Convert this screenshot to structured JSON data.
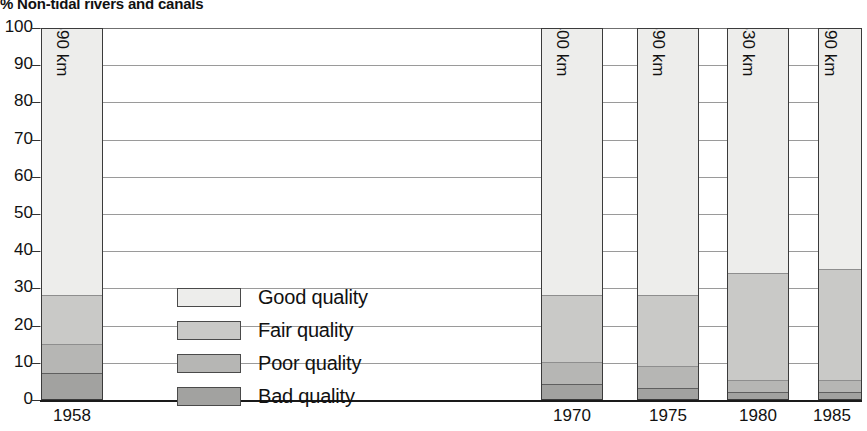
{
  "chart_data": {
    "type": "bar",
    "title": "% Non-tidal rivers and canals",
    "subtitle": "",
    "xlabel": "",
    "ylabel": "",
    "ylim": [
      0,
      100
    ],
    "yticks": [
      0,
      10,
      20,
      30,
      40,
      50,
      60,
      70,
      80,
      90,
      100
    ],
    "grid": true,
    "stacked": true,
    "stack_total_percent": 100,
    "legend_position": "inside-left-center",
    "categories": [
      "1958",
      "1970",
      "1975",
      "1980",
      "1985"
    ],
    "bar_annotations": [
      "34690 km",
      "38400 km",
      "38590 km",
      "40630 km",
      "41390 km"
    ],
    "series": [
      {
        "name": "Good quality",
        "color": "#ededeb",
        "values": [
          72,
          72,
          72,
          66,
          65
        ]
      },
      {
        "name": "Fair quality",
        "color": "#c9c9c7",
        "values": [
          13,
          18,
          19,
          29,
          30
        ]
      },
      {
        "name": "Poor quality",
        "color": "#b6b6b4",
        "values": [
          8,
          6,
          6,
          3,
          3
        ]
      },
      {
        "name": "Bad quality",
        "color": "#a2a2a0",
        "values": [
          7,
          4,
          3,
          2,
          2
        ]
      }
    ]
  },
  "legend": {
    "items": [
      {
        "label": "Good quality",
        "swatch": "good"
      },
      {
        "label": "Fair quality",
        "swatch": "fair"
      },
      {
        "label": "Poor quality",
        "swatch": "poor"
      },
      {
        "label": "Bad quality",
        "swatch": "bad"
      }
    ]
  },
  "axis": {
    "y_labels": [
      "100",
      "90",
      "80",
      "70",
      "60",
      "50",
      "40",
      "30",
      "20",
      "10",
      "0"
    ],
    "x_labels": [
      "1958",
      "1970",
      "1975",
      "1980",
      "1985"
    ]
  },
  "bars": [
    {
      "year": "1958",
      "value_label": "34690 km",
      "good": 72,
      "fair": 13,
      "poor": 8,
      "bad": 7
    },
    {
      "year": "1970",
      "value_label": "38400 km",
      "good": 72,
      "fair": 18,
      "poor": 6,
      "bad": 4
    },
    {
      "year": "1975",
      "value_label": "38590 km",
      "good": 72,
      "fair": 19,
      "poor": 6,
      "bad": 3
    },
    {
      "year": "1980",
      "value_label": "40630 km",
      "good": 66,
      "fair": 29,
      "poor": 3,
      "bad": 2
    },
    {
      "year": "1985",
      "value_label": "41390 km",
      "good": 65,
      "fair": 30,
      "poor": 3,
      "bad": 2
    }
  ]
}
